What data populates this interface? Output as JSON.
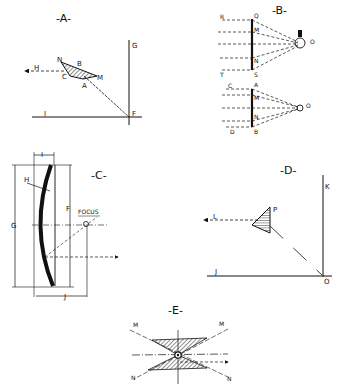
{
  "figures": {
    "A": {
      "title": "-A-",
      "labels": {
        "G": "G",
        "H": "H",
        "N": "N",
        "B": "B",
        "C": "C",
        "M": "M",
        "A": "A",
        "I": "I",
        "F": "F"
      }
    },
    "B": {
      "title": "-B-",
      "labels": {
        "R": "R",
        "Q": "Q",
        "M1": "M",
        "N1": "N",
        "T": "T",
        "S": "S",
        "O1": "O",
        "C": "C",
        "A": "A",
        "M2": "M",
        "N2": "N",
        "D": "D",
        "B": "B",
        "O2": "O"
      }
    },
    "C": {
      "title": "-C-",
      "labels": {
        "I": "I",
        "H": "H",
        "F": "F",
        "G": "G",
        "focus": "FOCUS",
        "J": "J"
      }
    },
    "D": {
      "title": "-D-",
      "labels": {
        "K": "K",
        "L": "L",
        "P": "P",
        "J": "J",
        "O": "O"
      }
    },
    "E": {
      "title": "-E-",
      "labels": {
        "M1": "M",
        "M2": "M",
        "N1": "N",
        "N2": "N"
      }
    }
  }
}
